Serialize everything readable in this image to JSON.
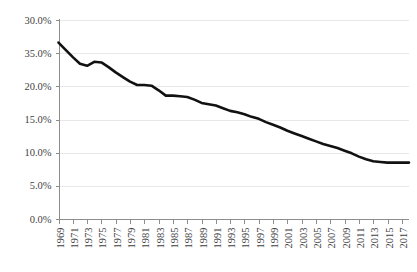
{
  "chart_data": {
    "type": "line",
    "title": "",
    "subtitle": "",
    "xlabel": "",
    "ylabel": "",
    "grid": true,
    "legend": false,
    "legend_position": "none",
    "line_color": "#111111",
    "gridline_color": "#e2e2e2",
    "axis_color": "#8d8d8d",
    "ylim": [
      0,
      30
    ],
    "ytick_labels": [
      "30.0%",
      "35.0%",
      "20.0%",
      "15.0%",
      "10.0%",
      "5.0%",
      "0.0%"
    ],
    "ytick_values": [
      30,
      25,
      20,
      15,
      10,
      5,
      0
    ],
    "xtick_labels": [
      "1969",
      "1971",
      "1973",
      "1975",
      "1977",
      "1979",
      "1981",
      "1983",
      "1985",
      "1987",
      "1989",
      "1991",
      "1993",
      "1995",
      "1997",
      "1999",
      "2001",
      "2003",
      "2005",
      "2007",
      "2009",
      "2011",
      "2013",
      "2015",
      "2017"
    ],
    "xlim": [
      1969,
      2018
    ],
    "x": [
      1969,
      1970,
      1971,
      1972,
      1973,
      1974,
      1975,
      1976,
      1977,
      1978,
      1979,
      1980,
      1981,
      1982,
      1983,
      1984,
      1985,
      1986,
      1987,
      1988,
      1989,
      1990,
      1991,
      1992,
      1993,
      1994,
      1995,
      1996,
      1997,
      1998,
      1999,
      2000,
      2001,
      2002,
      2003,
      2004,
      2005,
      2006,
      2007,
      2008,
      2009,
      2010,
      2011,
      2012,
      2013,
      2014,
      2015,
      2016,
      2017,
      2018
    ],
    "values": [
      26.6,
      25.5,
      24.4,
      23.4,
      23.1,
      23.7,
      23.6,
      22.9,
      22.1,
      21.4,
      20.7,
      20.2,
      20.2,
      20.1,
      19.4,
      18.6,
      18.6,
      18.5,
      18.4,
      18.0,
      17.5,
      17.3,
      17.1,
      16.7,
      16.3,
      16.1,
      15.8,
      15.4,
      15.1,
      14.6,
      14.2,
      13.8,
      13.3,
      12.9,
      12.5,
      12.1,
      11.7,
      11.3,
      11.0,
      10.7,
      10.3,
      9.9,
      9.4,
      9.0,
      8.7,
      8.6,
      8.5,
      8.5,
      8.5,
      8.5
    ],
    "series": [
      {
        "name": "series-1",
        "values": [
          26.6,
          25.5,
          24.4,
          23.4,
          23.1,
          23.7,
          23.6,
          22.9,
          22.1,
          21.4,
          20.7,
          20.2,
          20.2,
          20.1,
          19.4,
          18.6,
          18.6,
          18.5,
          18.4,
          18.0,
          17.5,
          17.3,
          17.1,
          16.7,
          16.3,
          16.1,
          15.8,
          15.4,
          15.1,
          14.6,
          14.2,
          13.8,
          13.3,
          12.9,
          12.5,
          12.1,
          11.7,
          11.3,
          11.0,
          10.7,
          10.3,
          9.9,
          9.4,
          9.0,
          8.7,
          8.6,
          8.5,
          8.5,
          8.5,
          8.5
        ]
      }
    ]
  }
}
